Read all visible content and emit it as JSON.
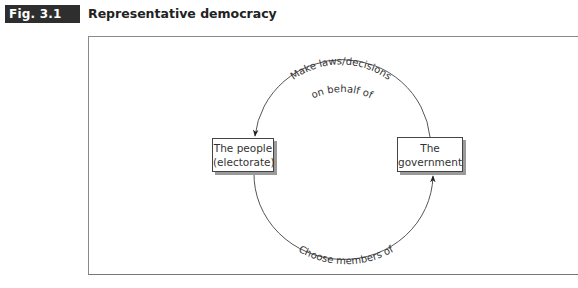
{
  "figure": {
    "label": "Fig. 3.1",
    "title": "Representative democracy"
  },
  "diagram": {
    "nodes": [
      {
        "id": "people",
        "lines": [
          "The people",
          "(electorate)"
        ]
      },
      {
        "id": "government",
        "lines": [
          "The",
          "government"
        ]
      }
    ],
    "edges": [
      {
        "from": "government",
        "to": "people",
        "label_lines": [
          "Make laws/decisions",
          "on behalf of"
        ],
        "position": "top-arc"
      },
      {
        "from": "people",
        "to": "government",
        "label_lines": [
          "Choose members of"
        ],
        "position": "bottom-arc"
      }
    ],
    "colors": {
      "label_bg": "#2e2e2e",
      "line": "#555555",
      "shadow": "#9a9a9a"
    }
  }
}
